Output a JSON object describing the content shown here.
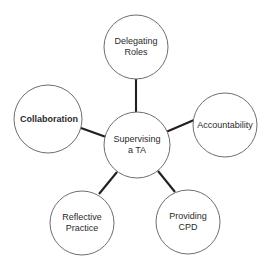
{
  "diagram": {
    "type": "mind-map",
    "background_color": "#ffffff",
    "node_fill": "#ffffff",
    "node_stroke": "#6e6e6e",
    "connector_color": "#231f20",
    "text_color": "#2b2b2b",
    "center": {
      "id": "supervising-a-ta",
      "lines": [
        "Supervising",
        "a TA"
      ],
      "text": "Supervising a TA",
      "bold": false,
      "cx": 137,
      "cy": 145,
      "r": 33
    },
    "nodes": [
      {
        "id": "delegating-roles",
        "lines": [
          "Delegating",
          "Roles"
        ],
        "text": "Delegating Roles",
        "bold": false,
        "cx": 136,
        "cy": 47,
        "r": 32
      },
      {
        "id": "accountability",
        "lines": [
          "Accountability"
        ],
        "text": "Accountability",
        "bold": false,
        "cx": 225,
        "cy": 125,
        "r": 32
      },
      {
        "id": "providing-cpd",
        "lines": [
          "Providing",
          "CPD"
        ],
        "text": "Providing CPD",
        "bold": false,
        "cx": 188,
        "cy": 222,
        "r": 32
      },
      {
        "id": "reflective-practice",
        "lines": [
          "Reflective",
          "Practice"
        ],
        "text": "Reflective Practice",
        "bold": false,
        "cx": 82,
        "cy": 223,
        "r": 32
      },
      {
        "id": "collaboration",
        "lines": [
          "Collaboration"
        ],
        "text": "Collaboration",
        "bold": true,
        "cx": 48,
        "cy": 119,
        "r": 34
      }
    ],
    "connectors": [
      {
        "id": "center-to-delegating-roles",
        "x1": 136,
        "y1": 112,
        "x2": 136,
        "y2": 79
      },
      {
        "id": "center-to-accountability",
        "x1": 166,
        "y1": 132,
        "x2": 194,
        "y2": 120
      },
      {
        "id": "center-to-providing-cpd",
        "x1": 158,
        "y1": 171,
        "x2": 175,
        "y2": 192
      },
      {
        "id": "center-to-reflective-practice",
        "x1": 117,
        "y1": 172,
        "x2": 99,
        "y2": 194
      },
      {
        "id": "center-to-collaboration",
        "x1": 106,
        "y1": 137,
        "x2": 81,
        "y2": 128
      }
    ]
  }
}
